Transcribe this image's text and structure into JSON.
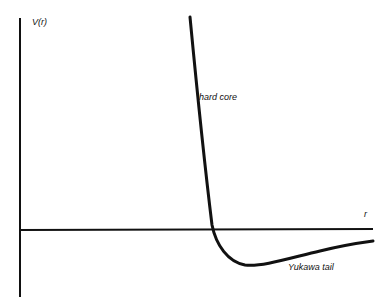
{
  "diagram": {
    "y_axis_label": "V(r)",
    "x_axis_label": "r",
    "annotations": {
      "hard_core": "hard core",
      "yukawa_tail": "Yukawa tail"
    },
    "colors": {
      "line": "#111111",
      "background": "#ffffff"
    }
  }
}
